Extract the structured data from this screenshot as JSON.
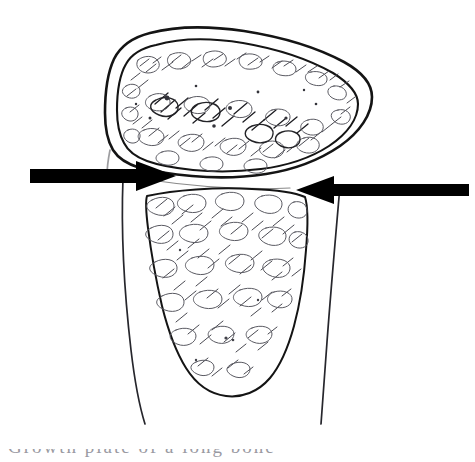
{
  "figure": {
    "background_color": "#ffffff",
    "ink_color": "#141414",
    "hatch_color": "#4a4a52",
    "arrow_color": "#000000",
    "width_px": 475,
    "height_px": 462,
    "caption_partial_text": "Growth plate of a long bone"
  },
  "annotations": {
    "left_arrow": {
      "label": "left-pointing-marker",
      "direction": "right",
      "tail_x": 30,
      "tip_x": 176,
      "center_y": 176,
      "color": "#000000"
    },
    "right_arrow": {
      "label": "right-pointing-marker",
      "direction": "left",
      "tail_x": 469,
      "tip_x": 296,
      "center_y": 190,
      "color": "#000000"
    }
  },
  "anatomy": {
    "parts": [
      {
        "name": "epiphysis-cartilage",
        "label": "Epiphyseal cartilage envelope"
      },
      {
        "name": "ossification-nucleus",
        "label": "Secondary ossification centre"
      },
      {
        "name": "growth-plate",
        "label": "Growth plate (physis)"
      },
      {
        "name": "metaphysis",
        "label": "Metaphysis trabecular bone"
      },
      {
        "name": "diaphysis-cortex",
        "label": "Diaphyseal cortex"
      }
    ]
  }
}
